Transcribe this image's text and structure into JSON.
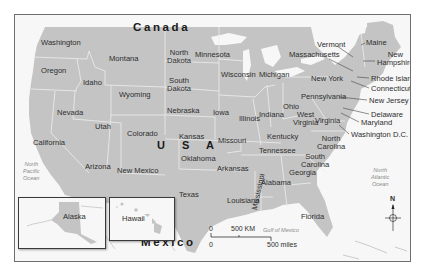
{
  "map": {
    "countries": {
      "north": "Canada",
      "south": "Mexico",
      "main": "USA"
    },
    "usa_label": "U S A",
    "colors": {
      "land_us": "#c4c4c4",
      "land_other": "#f7f7f7",
      "border": "#6e6e6e",
      "state_border": "#eeeeee",
      "water_text": "#8a8a8a"
    },
    "states": [
      {
        "name": "Washington"
      },
      {
        "name": "Oregon"
      },
      {
        "name": "California"
      },
      {
        "name": "Nevada"
      },
      {
        "name": "Idaho"
      },
      {
        "name": "Montana"
      },
      {
        "name": "Wyoming"
      },
      {
        "name": "Utah"
      },
      {
        "name": "Arizona"
      },
      {
        "name": "Colorado"
      },
      {
        "name": "New Mexico"
      },
      {
        "name": "North Dakota"
      },
      {
        "name": "South Dakota"
      },
      {
        "name": "Nebraska"
      },
      {
        "name": "Kansas"
      },
      {
        "name": "Oklahoma"
      },
      {
        "name": "Texas"
      },
      {
        "name": "Minnesota"
      },
      {
        "name": "Iowa"
      },
      {
        "name": "Missouri"
      },
      {
        "name": "Arkansas"
      },
      {
        "name": "Louisiana"
      },
      {
        "name": "Wisconsin"
      },
      {
        "name": "Illinois"
      },
      {
        "name": "Michigan"
      },
      {
        "name": "Indiana"
      },
      {
        "name": "Ohio"
      },
      {
        "name": "Kentucky"
      },
      {
        "name": "Tennessee"
      },
      {
        "name": "Mississippi"
      },
      {
        "name": "Alabama"
      },
      {
        "name": "Georgia"
      },
      {
        "name": "Florida"
      },
      {
        "name": "South Carolina"
      },
      {
        "name": "North Carolina"
      },
      {
        "name": "Virginia"
      },
      {
        "name": "West Virginia"
      },
      {
        "name": "Pennsylvania"
      },
      {
        "name": "New York"
      },
      {
        "name": "Vermont"
      },
      {
        "name": "Maine"
      },
      {
        "name": "New Hampshire"
      },
      {
        "name": "Massachusetts"
      },
      {
        "name": "Rhode Island"
      },
      {
        "name": "Connecticut"
      },
      {
        "name": "New Jersey"
      },
      {
        "name": "Delaware"
      },
      {
        "name": "Maryland"
      },
      {
        "name": "Washington D.C."
      }
    ],
    "labels": {
      "north_dakota": [
        "North",
        "Dakota"
      ],
      "south_dakota": [
        "South",
        "Dakota"
      ],
      "north_carolina": [
        "North",
        "Carolina"
      ],
      "south_carolina": [
        "South",
        "Carolina"
      ],
      "west_virginia": [
        "West",
        "Virginia"
      ],
      "new_hampshire": [
        "New",
        "Hampshire"
      ]
    },
    "insets": [
      {
        "name": "Alaska"
      },
      {
        "name": "Hawaii"
      }
    ],
    "water": {
      "pacific": [
        "North",
        "Pacific",
        "Ocean"
      ],
      "atlantic": [
        "North",
        "Atlantic",
        "Ocean"
      ],
      "gulf": "Gulf of Mexico"
    },
    "scale": {
      "zero_km": "0",
      "km_label": "500 KM",
      "zero_mi": "0",
      "mi_label": "500 miles"
    },
    "compass": {
      "north_label": "N"
    }
  }
}
